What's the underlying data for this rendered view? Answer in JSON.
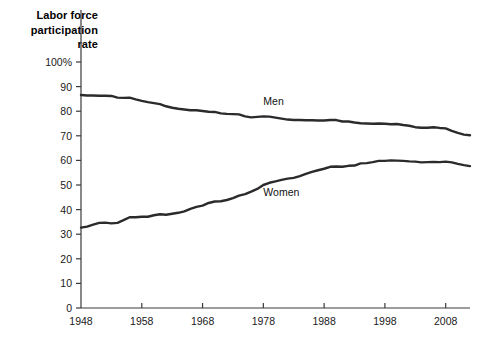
{
  "chart_data": {
    "type": "line",
    "title": "Labor force participation rate",
    "title_lines": [
      "Labor force",
      "participation",
      "rate"
    ],
    "xlabel": "",
    "ylabel": "Labor force participation rate",
    "xlim": [
      1948,
      2012
    ],
    "ylim": [
      0,
      100
    ],
    "grid": false,
    "legend_position": "inline-annotation",
    "x_ticks": [
      1948,
      1958,
      1968,
      1978,
      1988,
      1998,
      2008
    ],
    "x_tick_labels": [
      "1948",
      "1958",
      "1968",
      "1978",
      "1988",
      "1998",
      "2008"
    ],
    "y_ticks": [
      0,
      10,
      20,
      30,
      40,
      50,
      60,
      70,
      80,
      90,
      100
    ],
    "y_tick_labels": [
      "0",
      "10",
      "20",
      "30",
      "40",
      "50",
      "60",
      "70",
      "80",
      "90",
      "100%"
    ],
    "series": [
      {
        "name": "Men",
        "color": "#2b2b2b",
        "label_x": 1978,
        "label_y": 84,
        "x": [
          1948,
          1949,
          1950,
          1951,
          1952,
          1953,
          1954,
          1955,
          1956,
          1957,
          1958,
          1959,
          1960,
          1961,
          1962,
          1963,
          1964,
          1965,
          1966,
          1967,
          1968,
          1969,
          1970,
          1971,
          1972,
          1973,
          1974,
          1975,
          1976,
          1977,
          1978,
          1979,
          1980,
          1981,
          1982,
          1983,
          1984,
          1985,
          1986,
          1987,
          1988,
          1989,
          1990,
          1991,
          1992,
          1993,
          1994,
          1995,
          1996,
          1997,
          1998,
          1999,
          2000,
          2001,
          2002,
          2003,
          2004,
          2005,
          2006,
          2007,
          2008,
          2009,
          2010,
          2011,
          2012
        ],
        "values": [
          86.6,
          86.4,
          86.4,
          86.3,
          86.3,
          86.2,
          85.5,
          85.4,
          85.5,
          84.8,
          84.2,
          83.7,
          83.3,
          82.9,
          82.0,
          81.4,
          81.0,
          80.7,
          80.4,
          80.4,
          80.1,
          79.8,
          79.7,
          79.1,
          78.9,
          78.8,
          78.7,
          77.9,
          77.5,
          77.7,
          77.9,
          77.8,
          77.4,
          77.0,
          76.6,
          76.4,
          76.4,
          76.3,
          76.3,
          76.2,
          76.2,
          76.4,
          76.4,
          75.8,
          75.8,
          75.4,
          75.1,
          75.0,
          74.9,
          75.0,
          74.9,
          74.7,
          74.8,
          74.4,
          74.1,
          73.5,
          73.3,
          73.3,
          73.5,
          73.2,
          73.0,
          72.0,
          71.2,
          70.5,
          70.2
        ]
      },
      {
        "name": "Women",
        "color": "#2b2b2b",
        "label_x": 1978,
        "label_y": 47,
        "x": [
          1948,
          1949,
          1950,
          1951,
          1952,
          1953,
          1954,
          1955,
          1956,
          1957,
          1958,
          1959,
          1960,
          1961,
          1962,
          1963,
          1964,
          1965,
          1966,
          1967,
          1968,
          1969,
          1970,
          1971,
          1972,
          1973,
          1974,
          1975,
          1976,
          1977,
          1978,
          1979,
          1980,
          1981,
          1982,
          1983,
          1984,
          1985,
          1986,
          1987,
          1988,
          1989,
          1990,
          1991,
          1992,
          1993,
          1994,
          1995,
          1996,
          1997,
          1998,
          1999,
          2000,
          2001,
          2002,
          2003,
          2004,
          2005,
          2006,
          2007,
          2008,
          2009,
          2010,
          2011,
          2012
        ],
        "values": [
          32.7,
          33.1,
          33.9,
          34.6,
          34.7,
          34.4,
          34.6,
          35.7,
          36.9,
          36.9,
          37.1,
          37.1,
          37.7,
          38.1,
          37.9,
          38.3,
          38.7,
          39.3,
          40.3,
          41.1,
          41.6,
          42.7,
          43.3,
          43.4,
          43.9,
          44.7,
          45.7,
          46.3,
          47.3,
          48.4,
          50.0,
          50.9,
          51.5,
          52.1,
          52.6,
          52.9,
          53.6,
          54.5,
          55.3,
          56.0,
          56.6,
          57.4,
          57.5,
          57.4,
          57.8,
          57.9,
          58.8,
          58.9,
          59.3,
          59.8,
          59.8,
          60.0,
          59.9,
          59.8,
          59.6,
          59.5,
          59.2,
          59.3,
          59.4,
          59.3,
          59.5,
          59.2,
          58.6,
          58.1,
          57.7
        ]
      }
    ]
  }
}
